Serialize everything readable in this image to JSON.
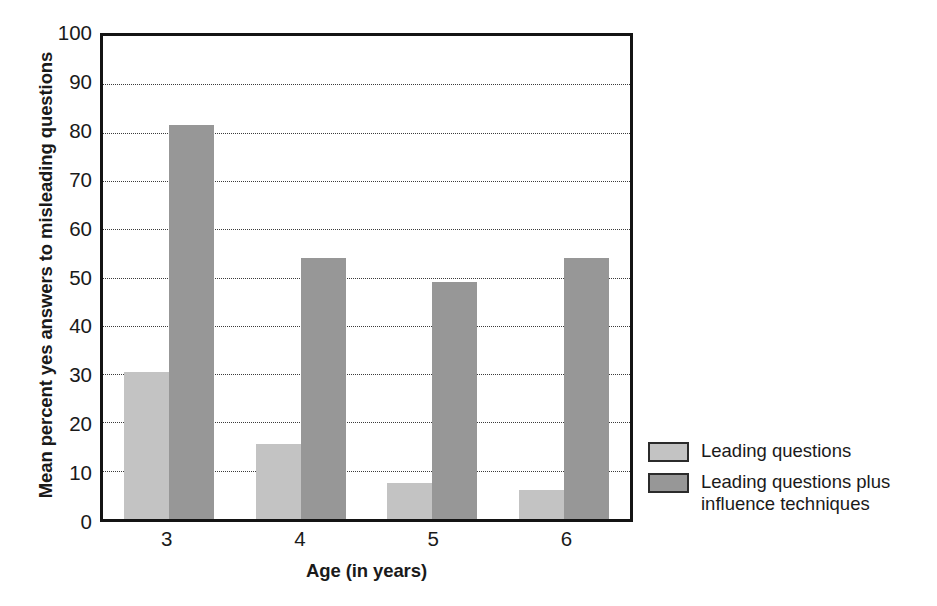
{
  "chart_data": {
    "type": "bar",
    "title": "",
    "xlabel": "Age (in years)",
    "ylabel": "Mean percent yes answers to misleading questions",
    "categories": [
      "3",
      "4",
      "5",
      "6"
    ],
    "ylim": [
      0,
      100
    ],
    "yticks": [
      "0",
      "10",
      "20",
      "30",
      "40",
      "50",
      "60",
      "70",
      "80",
      "90",
      "100"
    ],
    "ytick_values": [
      0,
      10,
      20,
      30,
      40,
      50,
      60,
      70,
      80,
      90,
      100
    ],
    "grid": true,
    "grid_axis": "y",
    "legend_position": "right",
    "series": [
      {
        "name": "Leading questions",
        "color": "#c3c3c3",
        "values": [
          30.5,
          15.5,
          7.5,
          6.0
        ]
      },
      {
        "name": "Leading questions plus influence techniques",
        "color": "#979797",
        "values": [
          81.5,
          54.0,
          49.0,
          54.0
        ]
      }
    ]
  },
  "legend": {
    "entries": [
      {
        "label": "Leading questions",
        "color": "#c3c3c3"
      },
      {
        "label": "Leading questions plus influence techniques",
        "color": "#979797"
      }
    ]
  },
  "colors": {
    "series_light": "#c3c3c3",
    "series_dark": "#979797",
    "axis": "#141414",
    "gridline": "#3b3b3b",
    "background": "#ffffff"
  }
}
